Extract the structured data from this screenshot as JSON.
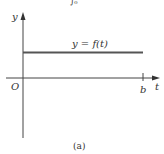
{
  "top_fragment": "∫₀",
  "axes": {
    "y_label": "y",
    "x_label": "t",
    "origin_label": "O"
  },
  "curve": {
    "label": "y = f(t)",
    "type": "constant horizontal line"
  },
  "tick": {
    "label": "b"
  },
  "caption": "(a)",
  "colors": {
    "line": "#555555",
    "axis": "#444444",
    "text": "#333333"
  }
}
